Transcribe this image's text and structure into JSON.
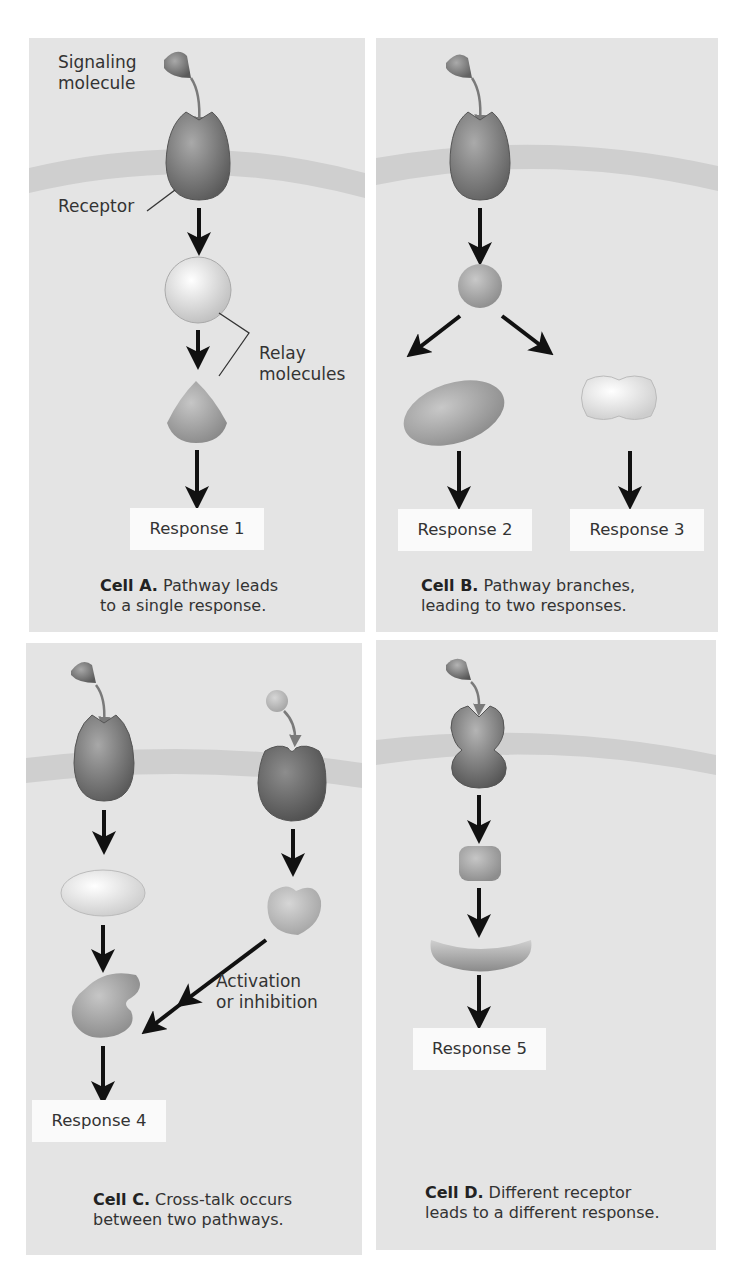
{
  "figure": {
    "panels": [
      {
        "id": "A",
        "labels": {
          "signaling": "Signaling\nmolecule",
          "signaling_line1": "Signaling",
          "signaling_line2": "molecule",
          "receptor": "Receptor",
          "relay_line1": "Relay",
          "relay_line2": "molecules"
        },
        "responses": [
          "Response 1"
        ],
        "caption_bold": "Cell A.",
        "caption_line1": " Pathway leads",
        "caption_line2": "to a single response."
      },
      {
        "id": "B",
        "responses": [
          "Response 2",
          "Response 3"
        ],
        "caption_bold": "Cell B.",
        "caption_line1": " Pathway branches,",
        "caption_line2": "leading to two responses."
      },
      {
        "id": "C",
        "labels": {
          "activation_line1": "Activation",
          "activation_line2": "or inhibition"
        },
        "responses": [
          "Response 4"
        ],
        "caption_bold": "Cell C.",
        "caption_line1": " Cross-talk occurs",
        "caption_line2": "between two pathways."
      },
      {
        "id": "D",
        "responses": [
          "Response 5"
        ],
        "caption_bold": "Cell D.",
        "caption_line1": " Different receptor",
        "caption_line2": "leads to a different response."
      }
    ],
    "colors": {
      "panel_bg": "#e4e4e4",
      "membrane": "#cfcfcf",
      "receptor_dark": "#6e6e6e",
      "arrow": "#111111",
      "response_box": "#fafafa"
    }
  }
}
